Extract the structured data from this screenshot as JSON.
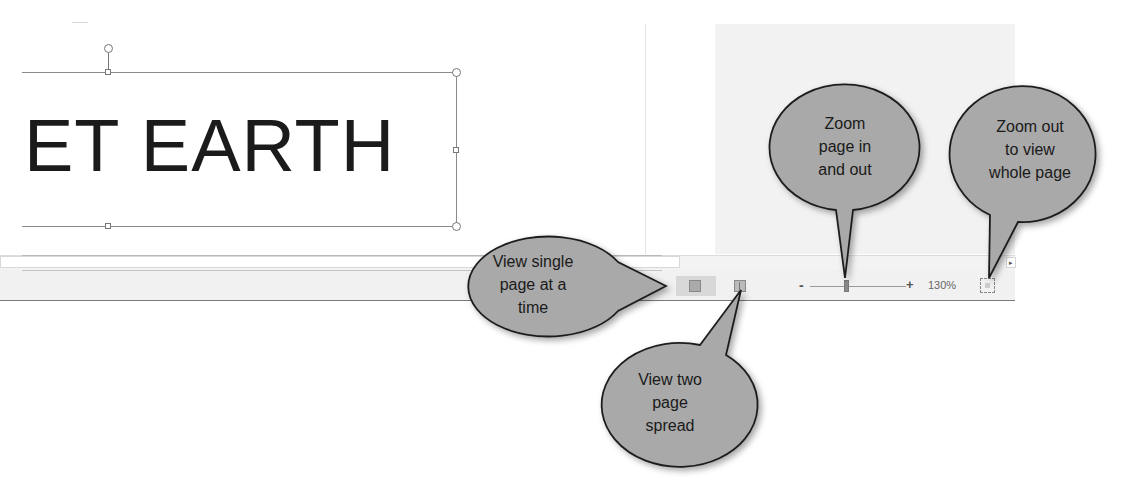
{
  "document": {
    "title_text": "ET EARTH"
  },
  "status_bar": {
    "zoom_minus": "-",
    "zoom_plus": "+",
    "zoom_level": "130%",
    "scroll_right_arrow": "▸",
    "icons": {
      "view_single": "single-page-view-icon",
      "view_two": "two-page-view-icon",
      "fit_page": "fit-whole-page-icon"
    }
  },
  "callouts": [
    {
      "id": "view-single",
      "lines": [
        "View single",
        "page at a",
        "time"
      ]
    },
    {
      "id": "view-two",
      "lines": [
        "View two",
        "page",
        "spread"
      ]
    },
    {
      "id": "zoom-in-out",
      "lines": [
        "Zoom",
        "page in",
        "and out"
      ]
    },
    {
      "id": "zoom-whole",
      "lines": [
        "Zoom out",
        "to view",
        "whole page"
      ]
    }
  ],
  "colors": {
    "callout_fill": "#a9a9a9",
    "callout_stroke": "#1e1e1e",
    "statusbar_bg": "#f1f1f1",
    "title_text": "#1b1b1b"
  }
}
